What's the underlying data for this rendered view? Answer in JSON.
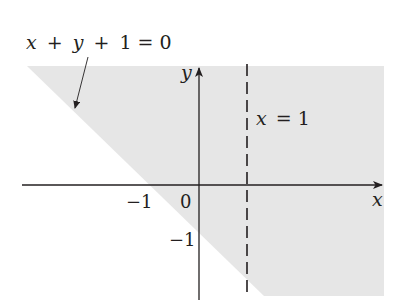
{
  "figure": {
    "type": "region-graph",
    "colors": {
      "background": "#ffffff",
      "region_fill": "#e6e6e6",
      "axis": "#231f20",
      "text": "#231f20"
    },
    "axes": {
      "x_label": "x",
      "y_label": "y",
      "origin_label": "0",
      "x_tick_label": "−1",
      "y_tick_label": "−1"
    },
    "boundary_line": {
      "equation": "x + y + 1 = 0",
      "style": "solid"
    },
    "vertical_line": {
      "equation": "x = 1",
      "style": "dashed"
    },
    "labels": {
      "boundary_eq_parts": [
        "x",
        "+",
        "y",
        "+",
        "1 = 0"
      ],
      "vertical_eq_parts": [
        "x",
        "= 1"
      ]
    }
  }
}
